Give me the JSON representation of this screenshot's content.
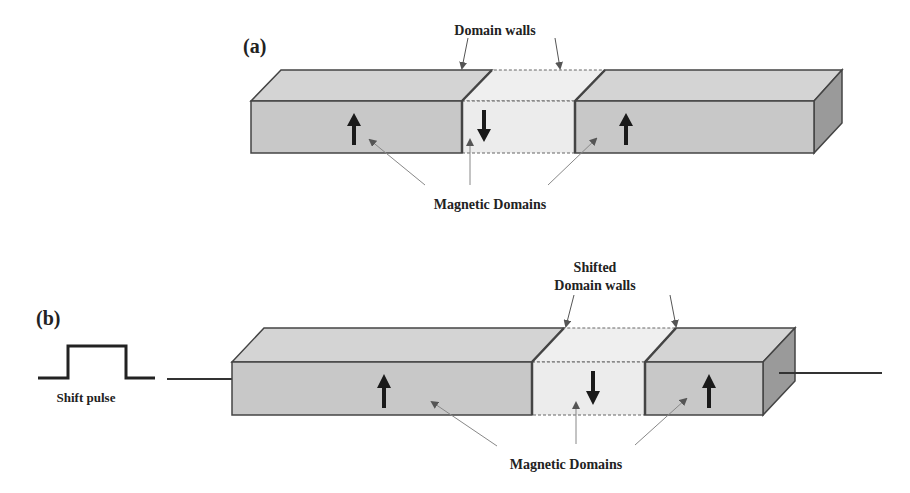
{
  "panel_a": {
    "label": "(a)",
    "walls_label": "Domain walls",
    "domains_label": "Magnetic Domains",
    "domains": [
      {
        "direction": "up"
      },
      {
        "direction": "down"
      },
      {
        "direction": "up"
      }
    ]
  },
  "panel_b": {
    "label": "(b)",
    "walls_label_line1": "Shifted",
    "walls_label_line2": "Domain walls",
    "domains_label": "Magnetic Domains",
    "pulse_label": "Shift pulse",
    "domains": [
      {
        "direction": "up"
      },
      {
        "direction": "down"
      },
      {
        "direction": "up"
      }
    ]
  },
  "colors": {
    "domain_fill": "#c8c8c8",
    "domain_top": "#d4d4d4",
    "middle_fill": "#ececec",
    "side_fill": "#9a9a9a",
    "outline": "#444444",
    "arrow": "#1a1a1a",
    "pointer": "#888888"
  }
}
